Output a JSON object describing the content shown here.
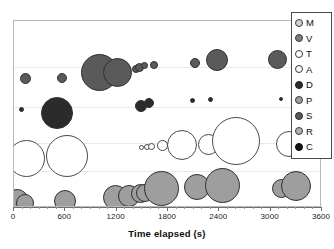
{
  "chart_data": {
    "type": "scatter",
    "title": "",
    "subtitle": "",
    "xlabel": "Time elapsed (s)",
    "ylabel": "",
    "xlim": [
      0,
      3600
    ],
    "xticks": [
      0,
      600,
      1200,
      1800,
      2400,
      3000,
      3600
    ],
    "xticklabels": [
      "0",
      "600",
      "1200",
      "1800",
      "2400",
      "3000",
      "3600"
    ],
    "ytick_labels": [],
    "grid": "horizontal",
    "legend_position": "top-right",
    "note": "Bubble chart: marker size encodes magnitude; each lettered category occupies a horizontal band (y is categorical/jittered). x = time elapsed in seconds.",
    "legend": [
      {
        "key": "M",
        "label": "M",
        "color": "#d0d0d0",
        "edge": "#3a3a3a"
      },
      {
        "key": "V",
        "label": "V",
        "color": "#7d7d7d",
        "edge": "#3a3a3a"
      },
      {
        "key": "T",
        "label": "T",
        "color": "#ffffff",
        "edge": "#3a3a3a"
      },
      {
        "key": "A",
        "label": "A",
        "color": "#fafafa",
        "edge": "#3a3a3a"
      },
      {
        "key": "D",
        "label": "D",
        "color": "#2b2b2b",
        "edge": "#1a1a1a"
      },
      {
        "key": "P",
        "label": "P",
        "color": "#9e9e9e",
        "edge": "#3a3a3a"
      },
      {
        "key": "S",
        "label": "S",
        "color": "#5a5a5a",
        "edge": "#2a2a2a"
      },
      {
        "key": "R",
        "label": "R",
        "color": "#b0b0b0",
        "edge": "#3a3a3a"
      },
      {
        "key": "C",
        "label": "C",
        "color": "#141414",
        "edge": "#0a0a0a"
      }
    ],
    "gridlines_y_frac": [
      0.245,
      0.46,
      0.655,
      0.8
    ],
    "points": [
      {
        "series": "S",
        "x": 140,
        "y_frac": 0.305,
        "r": 5.5,
        "color": "#5a5a5a"
      },
      {
        "series": "S",
        "x": 560,
        "y_frac": 0.305,
        "r": 5.0,
        "color": "#5a5a5a"
      },
      {
        "series": "S",
        "x": 1000,
        "y_frac": 0.275,
        "r": 18.5,
        "color": "#5a5a5a"
      },
      {
        "series": "S",
        "x": 1210,
        "y_frac": 0.275,
        "r": 14.5,
        "color": "#5a5a5a"
      },
      {
        "series": "S",
        "x": 1430,
        "y_frac": 0.255,
        "r": 4.0,
        "color": "#5a5a5a"
      },
      {
        "series": "S",
        "x": 1470,
        "y_frac": 0.25,
        "r": 4.5,
        "color": "#5a5a5a"
      },
      {
        "series": "S",
        "x": 1530,
        "y_frac": 0.24,
        "r": 3.5,
        "color": "#5a5a5a"
      },
      {
        "series": "S",
        "x": 1640,
        "y_frac": 0.235,
        "r": 4.0,
        "color": "#5a5a5a"
      },
      {
        "series": "S",
        "x": 2110,
        "y_frac": 0.225,
        "r": 5.0,
        "color": "#5a5a5a"
      },
      {
        "series": "S",
        "x": 2370,
        "y_frac": 0.21,
        "r": 11.0,
        "color": "#5a5a5a"
      },
      {
        "series": "S",
        "x": 3080,
        "y_frac": 0.205,
        "r": 9.5,
        "color": "#5a5a5a"
      },
      {
        "series": "S",
        "x": 3440,
        "y_frac": 0.205,
        "r": 4.0,
        "color": "#5a5a5a"
      },
      {
        "series": "D",
        "x": 90,
        "y_frac": 0.475,
        "r": 2.5,
        "color": "#2b2b2b"
      },
      {
        "series": "D",
        "x": 500,
        "y_frac": 0.49,
        "r": 16.0,
        "color": "#2b2b2b"
      },
      {
        "series": "D",
        "x": 1480,
        "y_frac": 0.455,
        "r": 6.0,
        "color": "#2b2b2b"
      },
      {
        "series": "D",
        "x": 1580,
        "y_frac": 0.44,
        "r": 5.0,
        "color": "#2b2b2b"
      },
      {
        "series": "D",
        "x": 2090,
        "y_frac": 0.425,
        "r": 2.5,
        "color": "#2b2b2b"
      },
      {
        "series": "D",
        "x": 2300,
        "y_frac": 0.42,
        "r": 2.5,
        "color": "#2b2b2b"
      },
      {
        "series": "D",
        "x": 3120,
        "y_frac": 0.415,
        "r": 2.0,
        "color": "#2b2b2b"
      },
      {
        "series": "T",
        "x": 150,
        "y_frac": 0.735,
        "r": 18.5,
        "color": "#ffffff"
      },
      {
        "series": "T",
        "x": 620,
        "y_frac": 0.72,
        "r": 21.0,
        "color": "#ffffff"
      },
      {
        "series": "T",
        "x": 1490,
        "y_frac": 0.675,
        "r": 2.5,
        "color": "#ffffff"
      },
      {
        "series": "T",
        "x": 1550,
        "y_frac": 0.672,
        "r": 3.0,
        "color": "#ffffff"
      },
      {
        "series": "T",
        "x": 1610,
        "y_frac": 0.67,
        "r": 3.5,
        "color": "#ffffff"
      },
      {
        "series": "T",
        "x": 1740,
        "y_frac": 0.668,
        "r": 5.5,
        "color": "#ffffff"
      },
      {
        "series": "T",
        "x": 1960,
        "y_frac": 0.665,
        "r": 15.0,
        "color": "#ffffff"
      },
      {
        "series": "T",
        "x": 2270,
        "y_frac": 0.662,
        "r": 10.5,
        "color": "#ffffff"
      },
      {
        "series": "T",
        "x": 2600,
        "y_frac": 0.64,
        "r": 24.0,
        "color": "#ffffff"
      },
      {
        "series": "T",
        "x": 3220,
        "y_frac": 0.66,
        "r": 13.0,
        "color": "#ffffff"
      },
      {
        "series": "P",
        "x": 30,
        "y_frac": 0.96,
        "r": 12.0,
        "color": "#9e9e9e"
      },
      {
        "series": "P",
        "x": 130,
        "y_frac": 0.975,
        "r": 9.0,
        "color": "#9e9e9e"
      },
      {
        "series": "P",
        "x": 600,
        "y_frac": 0.965,
        "r": 11.0,
        "color": "#9e9e9e"
      },
      {
        "series": "P",
        "x": 1190,
        "y_frac": 0.945,
        "r": 12.5,
        "color": "#9e9e9e"
      },
      {
        "series": "P",
        "x": 1340,
        "y_frac": 0.935,
        "r": 11.0,
        "color": "#9e9e9e"
      },
      {
        "series": "P",
        "x": 1480,
        "y_frac": 0.925,
        "r": 9.5,
        "color": "#9e9e9e"
      },
      {
        "series": "P",
        "x": 1530,
        "y_frac": 0.92,
        "r": 9.0,
        "color": "#9e9e9e"
      },
      {
        "series": "P",
        "x": 1720,
        "y_frac": 0.895,
        "r": 17.5,
        "color": "#9e9e9e"
      },
      {
        "series": "P",
        "x": 2140,
        "y_frac": 0.89,
        "r": 13.0,
        "color": "#9e9e9e"
      },
      {
        "series": "P",
        "x": 2440,
        "y_frac": 0.88,
        "r": 17.5,
        "color": "#9e9e9e"
      },
      {
        "series": "P",
        "x": 3130,
        "y_frac": 0.895,
        "r": 9.5,
        "color": "#9e9e9e"
      },
      {
        "series": "P",
        "x": 3300,
        "y_frac": 0.88,
        "r": 15.0,
        "color": "#9e9e9e"
      }
    ]
  }
}
